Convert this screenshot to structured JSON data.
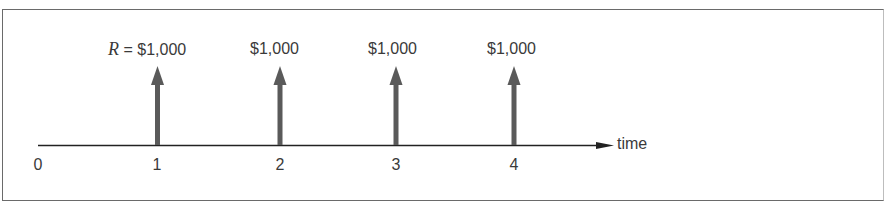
{
  "diagram": {
    "type": "cash-flow-timeline",
    "axis_label": "time",
    "ticks": [
      "0",
      "1",
      "2",
      "3",
      "4"
    ],
    "payments": [
      {
        "period": "1",
        "variable": "R",
        "equals": "=",
        "amount": "$1,000"
      },
      {
        "period": "2",
        "amount": "$1,000"
      },
      {
        "period": "3",
        "amount": "$1,000"
      },
      {
        "period": "4",
        "amount": "$1,000"
      }
    ],
    "colors": {
      "arrow": "#5a5a5a",
      "axis": "#222222",
      "text": "#3a3a3a",
      "frame": "#6a6a6a"
    }
  }
}
